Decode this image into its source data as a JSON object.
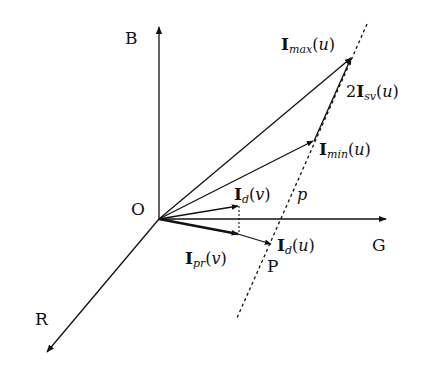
{
  "diagram": {
    "axes": {
      "blue": {
        "label": "B"
      },
      "green": {
        "label": "G"
      },
      "red": {
        "label": "R"
      },
      "origin": {
        "label": "O"
      }
    },
    "vectors": {
      "i_max": {
        "bold": "I",
        "sub": "max",
        "arg": "u"
      },
      "i_min": {
        "bold": "I",
        "sub": "min",
        "arg": "u"
      },
      "i_sv": {
        "coef": "2",
        "bold": "I",
        "sub": "sv",
        "arg": "u"
      },
      "i_d_v": {
        "bold": "I",
        "sub": "d",
        "arg": "v"
      },
      "i_d_u": {
        "bold": "I",
        "sub": "d",
        "arg": "u"
      },
      "i_pr_v": {
        "bold": "I",
        "sub": "pr",
        "arg": "v"
      }
    },
    "line": {
      "label": "p",
      "point_label": "P"
    },
    "colors": {
      "stroke": "#111111",
      "background": "#ffffff"
    }
  }
}
